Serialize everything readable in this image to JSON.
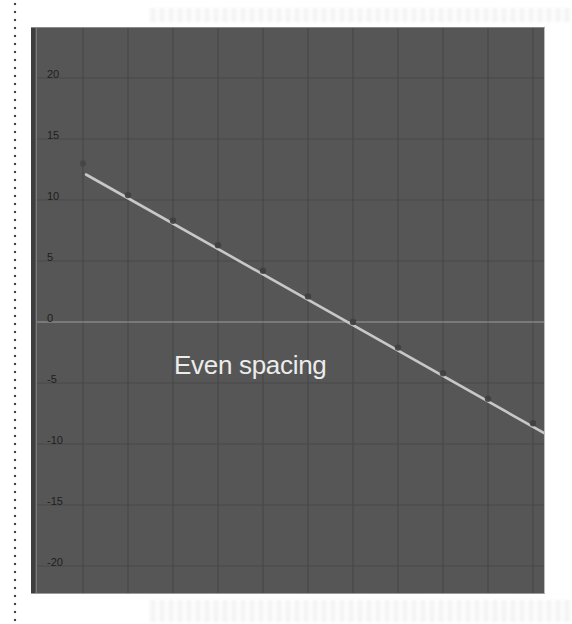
{
  "chart_data": {
    "type": "line",
    "title": "",
    "xlabel": "",
    "ylabel": "",
    "annotation": "Even spacing",
    "ylim": [
      -22,
      24
    ],
    "y_ticks": [
      20,
      15,
      10,
      5,
      0,
      -5,
      -10,
      -15,
      -20
    ],
    "grid": true,
    "legend": null,
    "series": [
      {
        "name": "line",
        "style": "straight line with evenly spaced points",
        "x": [
          0,
          1,
          2,
          3,
          4,
          5,
          6,
          7,
          8,
          9,
          10,
          10.25
        ],
        "values": [
          12.5,
          10.4,
          8.3,
          6.3,
          4.2,
          2.1,
          0,
          -2.1,
          -4.2,
          -6.3,
          -8.3,
          -9.2
        ]
      }
    ],
    "points_marked": [
      12.5,
      10.4,
      8.3,
      6.3,
      4.2,
      2.1,
      0,
      -2.1,
      -4.2,
      -6.3,
      -8.3
    ]
  },
  "colors": {
    "background": "#565656",
    "gridline": "#484848",
    "zero_line": "#9c9c9c",
    "series_line": "#c8c8c8",
    "point": "#3f3f3f",
    "tick_label": "#1e1e1e",
    "annotation": "#ececec"
  },
  "y_axis": {
    "labels": [
      "20",
      "15",
      "10",
      "5",
      "0",
      "-5",
      "-10",
      "-15",
      "-20"
    ]
  }
}
